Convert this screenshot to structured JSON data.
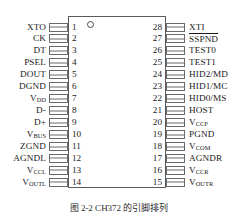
{
  "figure": {
    "type": "dip-pinout-diagram",
    "package": "28-pin dual in-line",
    "caption": "图 2-2  CH372 的引脚排列",
    "pin1_marker_icon": "pin1-circle-icon",
    "colors": {
      "outline": "#5a5a5a",
      "lead": "#6a6a6a",
      "text": "#1a1a1a",
      "background": "#ffffff"
    }
  },
  "pins": {
    "left": [
      {
        "number": "1",
        "label": "XTO",
        "sub": "",
        "overline": false
      },
      {
        "number": "2",
        "label": "CK",
        "sub": "",
        "overline": false
      },
      {
        "number": "3",
        "label": "DT",
        "sub": "",
        "overline": false
      },
      {
        "number": "4",
        "label": "PSEL",
        "sub": "",
        "overline": false
      },
      {
        "number": "5",
        "label": "DOUT",
        "sub": "",
        "overline": false
      },
      {
        "number": "6",
        "label": "DGND",
        "sub": "",
        "overline": false
      },
      {
        "number": "7",
        "label": "V",
        "sub": "DD",
        "overline": false
      },
      {
        "number": "8",
        "label": "D-",
        "sub": "",
        "overline": false
      },
      {
        "number": "9",
        "label": "D+",
        "sub": "",
        "overline": false
      },
      {
        "number": "10",
        "label": "V",
        "sub": "BUS",
        "overline": false
      },
      {
        "number": "11",
        "label": "ZGND",
        "sub": "",
        "overline": false
      },
      {
        "number": "12",
        "label": "AGNDL",
        "sub": "",
        "overline": false
      },
      {
        "number": "13",
        "label": "V",
        "sub": "CCL",
        "overline": false
      },
      {
        "number": "14",
        "label": "V",
        "sub": "OUTL",
        "overline": false
      }
    ],
    "right": [
      {
        "number": "28",
        "label": "XTI",
        "sub": "",
        "overline": false
      },
      {
        "number": "27",
        "label": "SSPND",
        "sub": "",
        "overline": true
      },
      {
        "number": "26",
        "label": "TEST0",
        "sub": "",
        "overline": false
      },
      {
        "number": "25",
        "label": "TEST1",
        "sub": "",
        "overline": false
      },
      {
        "number": "24",
        "label": "HID2/MD",
        "sub": "",
        "overline": false
      },
      {
        "number": "23",
        "label": "HID1/MC",
        "sub": "",
        "overline": false
      },
      {
        "number": "22",
        "label": "HID0/MS",
        "sub": "",
        "overline": false
      },
      {
        "number": "21",
        "label": "HOST",
        "sub": "",
        "overline": false
      },
      {
        "number": "20",
        "label": "V",
        "sub": "CCP",
        "overline": false
      },
      {
        "number": "19",
        "label": "PGND",
        "sub": "",
        "overline": false
      },
      {
        "number": "18",
        "label": "V",
        "sub": "COM",
        "overline": false
      },
      {
        "number": "17",
        "label": "AGNDR",
        "sub": "",
        "overline": false
      },
      {
        "number": "16",
        "label": "V",
        "sub": "CCR",
        "overline": false
      },
      {
        "number": "15",
        "label": "V",
        "sub": "OUTR",
        "overline": false
      }
    ]
  }
}
